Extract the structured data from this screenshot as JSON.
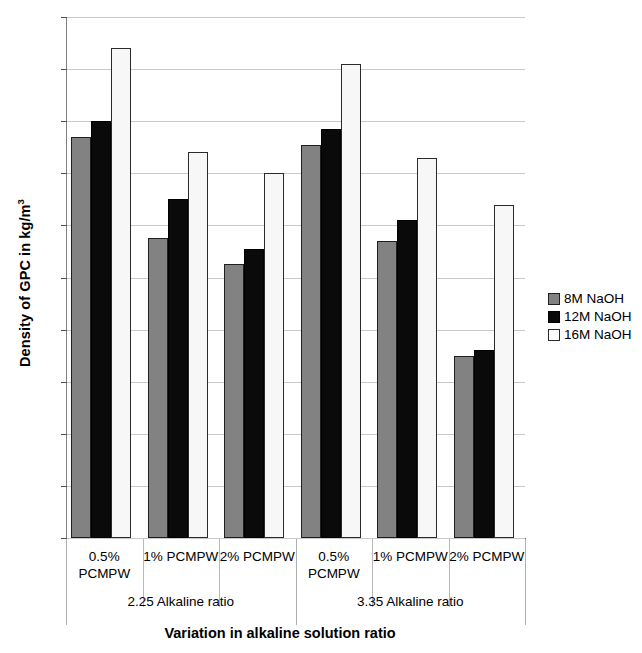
{
  "chart_data": {
    "type": "bar",
    "title": "",
    "xlabel": "Variation in alkaline solution ratio",
    "ylabel": "Density of GPC in kg/m",
    "ylabel_sup": "3",
    "ylim": [
      2280,
      2480
    ],
    "ytick_step": 20,
    "yticks": [
      2480,
      2460,
      2440,
      2420,
      2400,
      2380,
      2360,
      2340,
      2320,
      2300,
      2280
    ],
    "grid": true,
    "legend_position": "right",
    "categories": [
      "0.5%\nPCMPW",
      "1% PCMPW",
      "2% PCMPW",
      "0.5%\nPCMPW",
      "1% PCMPW",
      "2% PCMPW"
    ],
    "supergroups": [
      {
        "label": "2.25 Alkaline ratio",
        "categories": [
          0,
          1,
          2
        ]
      },
      {
        "label": "3.35 Alkaline ratio",
        "categories": [
          3,
          4,
          5
        ]
      }
    ],
    "series": [
      {
        "name": "8M NaOH",
        "color": "#828282",
        "values": [
          2434,
          2395,
          2385,
          2431,
          2394,
          2350
        ]
      },
      {
        "name": "12M NaOH",
        "color": "#0a0a0a",
        "values": [
          2440,
          2410,
          2391,
          2437,
          2402,
          2352
        ]
      },
      {
        "name": "16M NaOH",
        "color": "#ffffff",
        "values": [
          2468,
          2428,
          2420,
          2462,
          2426,
          2408
        ]
      }
    ]
  },
  "legend": {
    "items": [
      {
        "label": "8M NaOH"
      },
      {
        "label": "12M NaOH"
      },
      {
        "label": "16M NaOH"
      }
    ]
  }
}
